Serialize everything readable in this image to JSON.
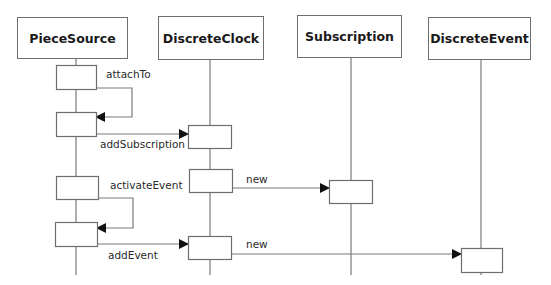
{
  "diagram": {
    "type": "sequence",
    "colors": {
      "line": "#7a7a7a",
      "box_border": "#6e6e6e",
      "text": "#1a1a1a",
      "arrowhead": "#111111"
    },
    "participants": [
      {
        "id": "piecesource",
        "label": "PieceSource",
        "box": [
          17,
          17,
          111,
          42
        ],
        "lifeline_x": 76,
        "lifeline_end": 275
      },
      {
        "id": "discreteclock",
        "label": "DiscreteClock",
        "box": [
          158,
          16,
          106,
          44
        ],
        "lifeline_x": 210,
        "lifeline_end": 275
      },
      {
        "id": "subscription",
        "label": "Subscription",
        "box": [
          297,
          15,
          105,
          43
        ],
        "lifeline_x": 351,
        "lifeline_end": 275
      },
      {
        "id": "discreteevent",
        "label": "DiscreteEvent",
        "box": [
          428,
          17,
          103,
          43
        ],
        "lifeline_x": 481,
        "lifeline_end": 275
      }
    ],
    "activations": [
      {
        "participant": "piecesource",
        "rect": [
          56,
          65,
          40,
          24
        ]
      },
      {
        "participant": "piecesource",
        "rect": [
          56,
          112,
          40,
          24
        ]
      },
      {
        "participant": "piecesource",
        "rect": [
          56,
          176,
          42,
          23
        ]
      },
      {
        "participant": "piecesource",
        "rect": [
          55,
          222,
          42,
          24
        ]
      },
      {
        "participant": "discreteclock",
        "rect": [
          188,
          125,
          43,
          23
        ]
      },
      {
        "participant": "discreteclock",
        "rect": [
          189,
          169,
          43,
          23
        ]
      },
      {
        "participant": "discreteclock",
        "rect": [
          188,
          236,
          43,
          23
        ]
      },
      {
        "participant": "subscription",
        "rect": [
          329,
          180,
          43,
          23
        ]
      },
      {
        "participant": "discreteevent",
        "rect": [
          461,
          248,
          41,
          24
        ]
      }
    ],
    "messages": [
      {
        "label": "attachTo",
        "type": "self",
        "from": "piecesource",
        "to": "piecesource",
        "path": [
          [
            96,
            88
          ],
          [
            132,
            88
          ],
          [
            132,
            117
          ],
          [
            96,
            117
          ]
        ],
        "label_pos": [
          106,
          68
        ]
      },
      {
        "label": "addSubscription",
        "type": "call",
        "from": "piecesource",
        "to": "discreteclock",
        "path": [
          [
            96,
            134
          ],
          [
            188,
            134
          ]
        ],
        "label_pos": [
          100,
          138
        ]
      },
      {
        "label": "new",
        "type": "create",
        "from": "discreteclock",
        "to": "subscription",
        "path": [
          [
            232,
            188
          ],
          [
            329,
            188
          ]
        ],
        "label_pos": [
          246,
          173
        ]
      },
      {
        "label": "activateEvent",
        "type": "self",
        "from": "piecesource",
        "to": "piecesource",
        "path": [
          [
            98,
            198
          ],
          [
            133,
            198
          ],
          [
            133,
            228
          ],
          [
            97,
            228
          ]
        ],
        "label_pos": [
          110,
          179
        ]
      },
      {
        "label": "addEvent",
        "type": "call",
        "from": "piecesource",
        "to": "discreteclock",
        "path": [
          [
            97,
            244
          ],
          [
            188,
            244
          ]
        ],
        "label_pos": [
          108,
          249
        ]
      },
      {
        "label": "new",
        "type": "create",
        "from": "discreteclock",
        "to": "discreteevent",
        "path": [
          [
            231,
            254
          ],
          [
            461,
            254
          ]
        ],
        "label_pos": [
          246,
          238
        ]
      }
    ]
  }
}
